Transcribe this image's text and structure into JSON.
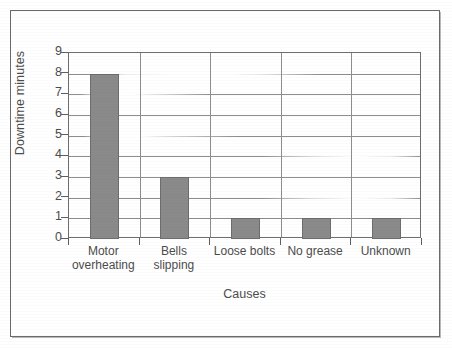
{
  "chart_data": {
    "type": "bar",
    "title": "",
    "subtitle": "",
    "xlabel": "Causes",
    "ylabel": "Downtime minutes",
    "categories": [
      "Motor\noverheating",
      "Bells\nslipping",
      "Loose bolts",
      "No grease",
      "Unknown"
    ],
    "categories_flat": [
      "Motor overheating",
      "Bells slipping",
      "Loose bolts",
      "No grease",
      "Unknown"
    ],
    "values": [
      8,
      3,
      1,
      1,
      1
    ],
    "ylim": [
      0,
      9
    ],
    "ytick_labels": [
      "9",
      "8",
      "7",
      "6",
      "5",
      "4",
      "3",
      "2",
      "1",
      "0"
    ],
    "ytick_values": [
      9,
      8,
      7,
      6,
      5,
      4,
      3,
      2,
      1,
      0
    ],
    "grid": "horizontal",
    "legend": "none",
    "bar_color": "#8a8a8a",
    "bar_border_color": "#6d6d6d",
    "axis_color": "#6e6e6e",
    "grid_color": "#8d8d8d",
    "text_color": "#4c4c4c",
    "background": "#ffffff"
  },
  "frame": {
    "border_color": "#6b6b6b"
  }
}
